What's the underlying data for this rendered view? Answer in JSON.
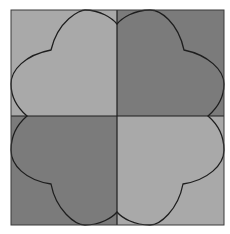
{
  "figure": {
    "colors": {
      "light": "#a9a9a9",
      "dark": "#7b7b7b",
      "stroke": "#1e1e1e",
      "background": "#ffffff"
    },
    "quadrants": [
      {
        "position": "top-left",
        "shade": "light"
      },
      {
        "position": "top-right",
        "shade": "dark"
      },
      {
        "position": "bottom-left",
        "shade": "dark"
      },
      {
        "position": "bottom-right",
        "shade": "light"
      }
    ]
  }
}
